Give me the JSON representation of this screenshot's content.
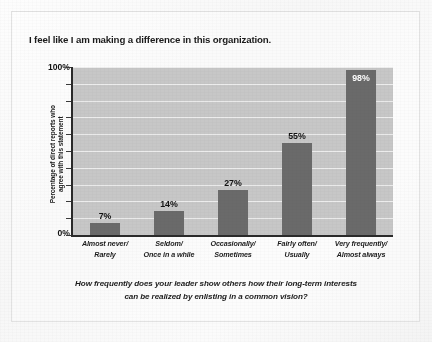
{
  "chart_data": {
    "type": "bar",
    "title": "I feel like I am making a difference in this organization.",
    "caption_line1": "How frequently does your leader show others how their long-term interests",
    "caption_line2": "can be realized by enlisting in a common vision?",
    "xlabel": "",
    "ylabel_line1": "Percentage of direct reports who",
    "ylabel_line2": "agree with this statement",
    "ylim": [
      0,
      100
    ],
    "ytick_labels": [
      "0%",
      "100%"
    ],
    "ytick_values": [
      0,
      10,
      20,
      30,
      40,
      50,
      60,
      70,
      80,
      90,
      100
    ],
    "grid": true,
    "legend": "none",
    "categories": [
      "Almost never/ Rarely",
      "Seldom/ Once in a while",
      "Occasionally/ Sometimes",
      "Fairly often/ Usually",
      "Very frequently/ Almost always"
    ],
    "category_lines": [
      [
        "Almost never/",
        "Rarely"
      ],
      [
        "Seldom/",
        "Once in a while"
      ],
      [
        "Occasionally/",
        "Sometimes"
      ],
      [
        "Fairly often/",
        "Usually"
      ],
      [
        "Very frequently/",
        "Almost always"
      ]
    ],
    "values": [
      7,
      14,
      27,
      55,
      98
    ],
    "value_labels": [
      "7%",
      "14%",
      "27%",
      "55%",
      "98%"
    ],
    "label_placement": [
      "outside",
      "outside",
      "outside",
      "outside",
      "inside"
    ],
    "colors": {
      "bar": "#6a6a6a",
      "plot_background": "#c7c7c7",
      "gridline": "#efefef",
      "axis": "#2a2a2a",
      "text": "#1b1b1b",
      "inside_label": "#ffffff",
      "page_background": "#f8f8f8"
    }
  }
}
